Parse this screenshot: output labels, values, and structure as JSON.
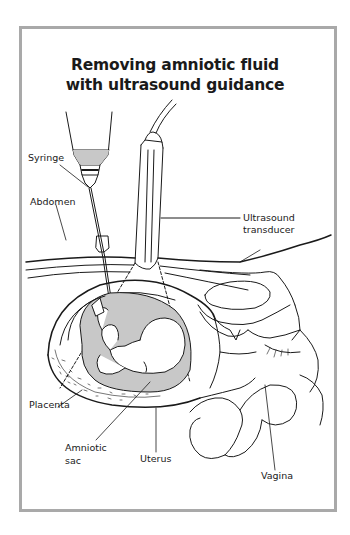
{
  "title": {
    "line1": "Removing amniotic fluid",
    "line2": "with ultrasound guidance"
  },
  "labels": {
    "syringe": "Syringe",
    "abdomen": "Abdomen",
    "ultrasound_line1": "Ultrasound",
    "ultrasound_line2": "transducer",
    "placenta": "Placenta",
    "amniotic_line1": "Amniotic",
    "amniotic_line2": "sac",
    "uterus": "Uterus",
    "vagina": "Vagina"
  },
  "colors": {
    "frame_border": "#a9a9a9",
    "fluid_fill": "#c8c8c8",
    "line": "#1a1a1a"
  }
}
